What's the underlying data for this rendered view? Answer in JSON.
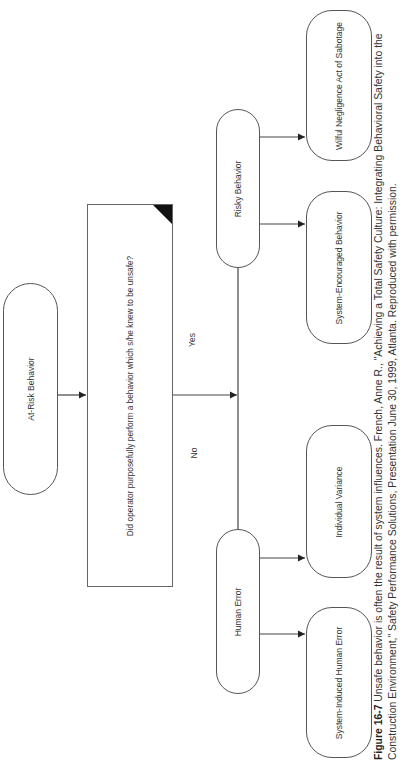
{
  "diagram": {
    "nodes": {
      "at_risk": {
        "label": "At-Risk Behavior"
      },
      "decision": {
        "label": "Did operator purposefully perform a behavior which s/he knew to be unsafe?"
      },
      "risky": {
        "label": "Risky Behavior"
      },
      "human_error": {
        "label": "Human Error"
      },
      "wilful": {
        "label": "Wilful Negligence Act of Sabotage"
      },
      "system_encouraged": {
        "label": "System-Encouraged Behavior"
      },
      "individual_variance": {
        "label": "Individual Variance"
      },
      "system_induced": {
        "label": "System-Induced Human Error"
      }
    },
    "edges": {
      "yes_label": "Yes",
      "no_label": "No"
    },
    "colors": {
      "stroke": "#555555",
      "corner_marker": "#111111",
      "background": "#ffffff"
    }
  },
  "caption": {
    "figure_number": "Figure 16-7",
    "text": " Unsafe behavior is often the result of system influences. French, Anne R., \"Achieving a Total Safety Culture: Integrating Behavioral Safety into the Construction Environment,\" Safety Performance Solutions, Presentation June 30, 1999, Atlanta. Reproduced with permission."
  }
}
